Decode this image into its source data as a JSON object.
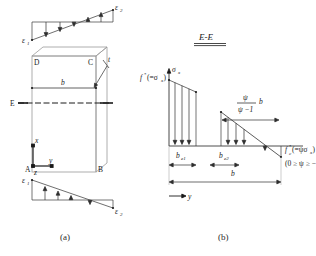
{
  "figure": {
    "caption_a": "(a)",
    "caption_b": "(b)",
    "title_b": "E-E"
  },
  "panel_a": {
    "strain_top": {
      "label_left": "ε",
      "label_left_sub": "1",
      "label_right": "ε",
      "label_right_sub": "2"
    },
    "strain_bottom": {
      "label_left": "ε",
      "label_left_sub": "1",
      "label_right": "ε",
      "label_right_sub": "2"
    },
    "corners": {
      "top_left": "D",
      "top_right": "C",
      "bottom_left": "A",
      "bottom_right": "B"
    },
    "dimension_width": "b",
    "thickness": "t",
    "section_line": "E",
    "axes": {
      "vertical": "x",
      "horizontal": "y",
      "origin": "z"
    }
  },
  "panel_b": {
    "stress_axis": "σ",
    "stress_axis_sub": "x",
    "stress_left": "f",
    "stress_left_star": "*",
    "stress_left_paren": "(=σ",
    "stress_left_paren_sub": "x",
    "stress_left_paren_end": ")",
    "stress_right": "f",
    "stress_right_sub": "c",
    "stress_right_star": "*",
    "stress_right_paren": "(=ψσ",
    "stress_right_paren_sub": "x",
    "stress_right_paren_end": ")",
    "psi_range": "(0 ≥ ψ ≥ −1)",
    "fraction_numerator": "ψ",
    "fraction_denominator": "ψ −1",
    "fraction_suffix": "b",
    "width_e1": "b",
    "width_e1_sub": "e1",
    "width_e2": "b",
    "width_e2_sub": "e2",
    "width_total": "b",
    "axis_y": "y"
  }
}
